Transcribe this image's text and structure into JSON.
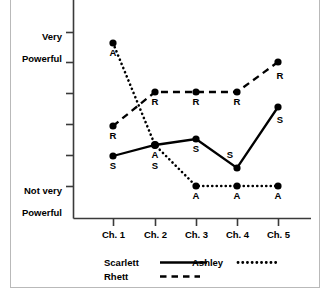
{
  "chart_data": {
    "type": "line",
    "title": "",
    "xlabel": "",
    "ylabel": "",
    "categories": [
      "Ch. 1",
      "Ch. 2",
      "Ch. 3",
      "Ch. 4",
      "Ch. 5"
    ],
    "ylim": [
      1,
      6
    ],
    "y_axis": {
      "tick_count": 6,
      "top_label": "Very\nPowerful",
      "bottom_label": "Not very\nPowerful",
      "top_label_line1": "Very",
      "top_label_line2": "Powerful",
      "bottom_label_line1": "Not very",
      "bottom_label_line2": "Powerful"
    },
    "grid": false,
    "legend_position": "below-axis",
    "series": [
      {
        "name": "Scarlett",
        "marker_letter": "S",
        "line_style": "solid",
        "color": "#000000",
        "values": [
          2.0,
          2.35,
          2.55,
          1.6,
          3.6
        ],
        "y_pixels": [
          156,
          145,
          139,
          168,
          107
        ]
      },
      {
        "name": "Rhett",
        "marker_letter": "R",
        "line_style": "dashed",
        "color": "#000000",
        "values": [
          2.95,
          4.05,
          4.05,
          4.05,
          5.05
        ],
        "y_pixels": [
          126,
          92,
          92,
          92,
          62
        ]
      },
      {
        "name": "Ashley",
        "marker_letter": "A",
        "line_style": "dotted",
        "color": "#000000",
        "values": [
          5.65,
          2.35,
          1.0,
          1.0,
          1.0
        ],
        "y_pixels": [
          43,
          145,
          186,
          186,
          186
        ]
      }
    ],
    "point_labels": [
      {
        "series": "Ashley",
        "category": "Ch. 1",
        "text": "A",
        "x": 113,
        "y": 43,
        "pos": "below"
      },
      {
        "series": "Rhett",
        "category": "Ch. 1",
        "text": "R",
        "x": 113,
        "y": 126,
        "pos": "below"
      },
      {
        "series": "Scarlett",
        "category": "Ch. 1",
        "text": "S",
        "x": 113,
        "y": 156,
        "pos": "below"
      },
      {
        "series": "Rhett",
        "category": "Ch. 2",
        "text": "R",
        "x": 155,
        "y": 92,
        "pos": "below"
      },
      {
        "series": "Ashley",
        "category": "Ch. 2",
        "text": "A",
        "x": 155,
        "y": 145,
        "pos": "below"
      },
      {
        "series": "Scarlett",
        "category": "Ch. 2",
        "text": "S",
        "x": 155,
        "y": 145,
        "pos": "below2"
      },
      {
        "series": "Rhett",
        "category": "Ch. 3",
        "text": "R",
        "x": 196,
        "y": 92,
        "pos": "below"
      },
      {
        "series": "Scarlett",
        "category": "Ch. 3",
        "text": "S",
        "x": 196,
        "y": 139,
        "pos": "below"
      },
      {
        "series": "Ashley",
        "category": "Ch. 3",
        "text": "A",
        "x": 196,
        "y": 186,
        "pos": "below"
      },
      {
        "series": "Rhett",
        "category": "Ch. 4",
        "text": "R",
        "x": 237,
        "y": 92,
        "pos": "below"
      },
      {
        "series": "Scarlett",
        "category": "Ch. 4",
        "text": "S",
        "x": 230,
        "y": 154,
        "pos": "left"
      },
      {
        "series": "Ashley",
        "category": "Ch. 4",
        "text": "A",
        "x": 237,
        "y": 186,
        "pos": "below"
      },
      {
        "series": "Rhett",
        "category": "Ch. 5",
        "text": "R",
        "x": 280,
        "y": 70,
        "pos": "below"
      },
      {
        "series": "Scarlett",
        "category": "Ch. 5",
        "text": "S",
        "x": 280,
        "y": 115,
        "pos": "below"
      },
      {
        "series": "Ashley",
        "category": "Ch. 5",
        "text": "A",
        "x": 278,
        "y": 186,
        "pos": "below"
      }
    ]
  },
  "legend": {
    "entries": [
      {
        "label": "Scarlett",
        "style": "solid"
      },
      {
        "label": "Ashley",
        "style": "dotted"
      },
      {
        "label": "Rhett",
        "style": "dashed"
      }
    ]
  }
}
